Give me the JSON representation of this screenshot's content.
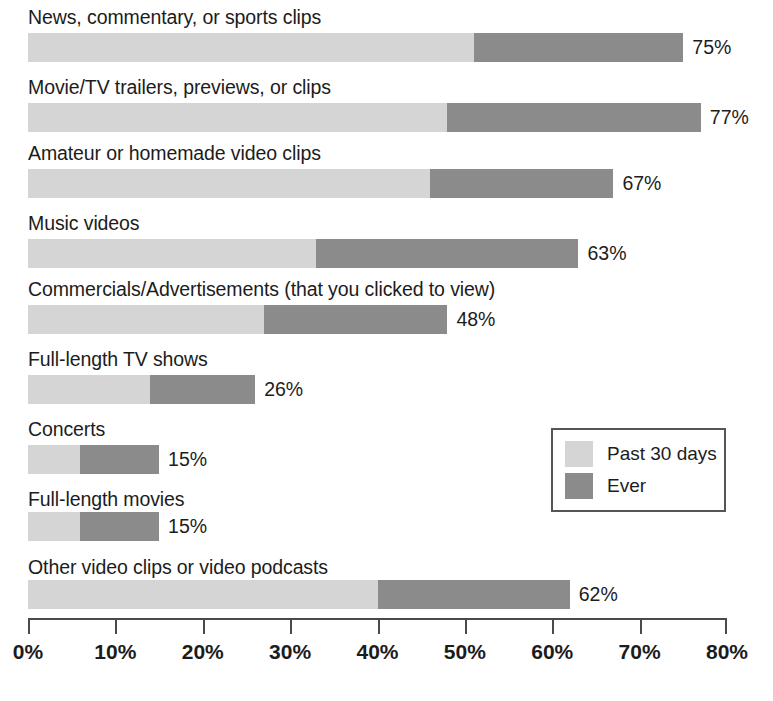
{
  "chart_data": {
    "type": "bar",
    "orientation": "horizontal",
    "stacked": true,
    "title": "",
    "subtitle": "",
    "xlabel": "",
    "ylabel": "",
    "xlim": [
      0,
      80
    ],
    "grid": false,
    "legend_position": "inside-right",
    "categories": [
      "News, commentary, or sports clips",
      "Movie/TV trailers, previews, or clips",
      "Amateur or homemade video clips",
      "Music videos",
      "Commercials/Advertisements (that you clicked to view)",
      "Full-length TV shows",
      "Concerts",
      "Full-length movies",
      "Other video clips or video podcasts"
    ],
    "series": [
      {
        "name": "Past 30 days",
        "color": "#d5d5d5",
        "values": [
          51,
          48,
          46,
          33,
          27,
          14,
          6,
          6,
          40
        ]
      },
      {
        "name": "Ever",
        "color": "#8b8b8b",
        "values": [
          24,
          29,
          21,
          30,
          21,
          12,
          9,
          9,
          22
        ]
      }
    ],
    "totals": [
      75,
      77,
      67,
      63,
      48,
      26,
      15,
      15,
      62
    ],
    "value_labels": [
      "75%",
      "77%",
      "67%",
      "63%",
      "48%",
      "26%",
      "15%",
      "15%",
      "62%"
    ],
    "x_ticks": [
      0,
      10,
      20,
      30,
      40,
      50,
      60,
      70,
      80
    ],
    "x_tick_labels": [
      "0%",
      "10%",
      "20%",
      "30%",
      "40%",
      "50%",
      "60%",
      "70%",
      "80%"
    ]
  },
  "legend": {
    "items": [
      {
        "label": "Past 30 days",
        "color": "#d5d5d5"
      },
      {
        "label": "Ever",
        "color": "#8b8b8b"
      }
    ]
  },
  "colors": {
    "past_30_days": "#d5d5d5",
    "ever": "#8b8b8b",
    "axis": "#4a4a4a",
    "text": "#1c1c1c",
    "background": "#ffffff"
  }
}
